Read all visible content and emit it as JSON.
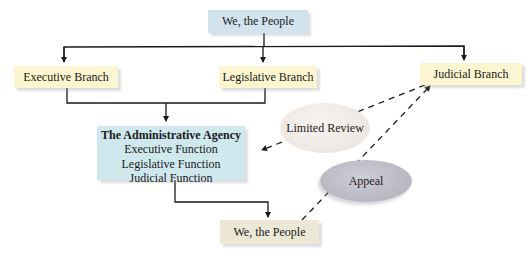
{
  "diagram": {
    "nodes": {
      "people_top": {
        "label": "We, the People",
        "color": "#d3e3ee"
      },
      "executive": {
        "label": "Executive Branch",
        "color": "#fbf6cf"
      },
      "legislative": {
        "label": "Legislative Branch",
        "color": "#fbf6cf"
      },
      "judicial": {
        "label": "Judicial Branch",
        "color": "#fbf6cf"
      },
      "agency": {
        "title": "The Administrative Agency",
        "functions": [
          "Executive Function",
          "Legislative Function",
          "Judicial Function"
        ],
        "color": "#cfe8ee"
      },
      "people_bottom": {
        "label": "We, the People",
        "color": "#ebe8d6"
      }
    },
    "relations": {
      "limited_review": {
        "label": "Limited Review",
        "style": "dashed",
        "from": "Judicial Branch",
        "to": "The Administrative Agency"
      },
      "appeal": {
        "label": "Appeal",
        "style": "dashed",
        "from": "We, the People",
        "to": "Judicial Branch"
      }
    },
    "edges": [
      {
        "from": "We, the People",
        "to": "Executive Branch",
        "style": "solid"
      },
      {
        "from": "We, the People",
        "to": "Legislative Branch",
        "style": "solid"
      },
      {
        "from": "We, the People",
        "to": "Judicial Branch",
        "style": "solid"
      },
      {
        "from": "Executive Branch",
        "to": "The Administrative Agency",
        "style": "solid"
      },
      {
        "from": "Legislative Branch",
        "to": "The Administrative Agency",
        "style": "solid"
      },
      {
        "from": "The Administrative Agency",
        "to": "We, the People",
        "style": "solid"
      }
    ]
  }
}
